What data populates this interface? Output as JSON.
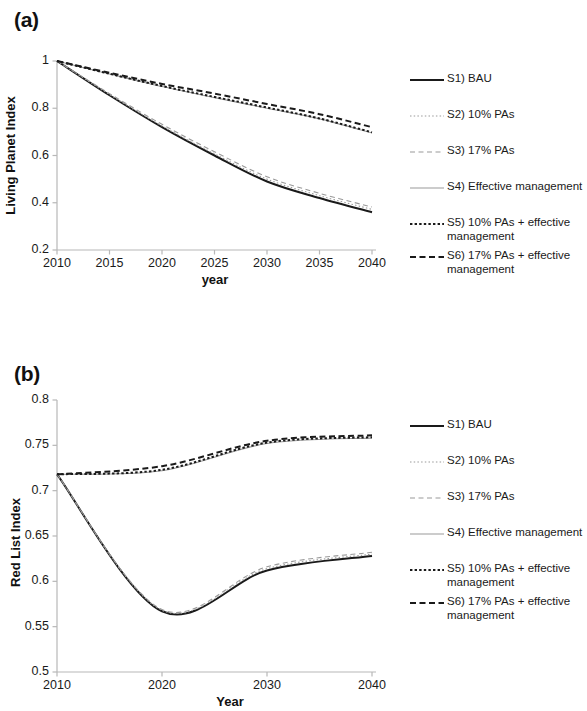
{
  "figure": {
    "panels": [
      {
        "id": "a",
        "label": "(a)",
        "ylabel": "Living Planet Index",
        "xlabel": "year"
      },
      {
        "id": "b",
        "label": "(b)",
        "ylabel": "Red List Index",
        "xlabel": "Year"
      }
    ]
  },
  "legend": {
    "items": [
      {
        "key": "S1",
        "label": "S1) BAU",
        "style": "solid-thick-dark",
        "color": "#1a1a1a"
      },
      {
        "key": "S2",
        "label": "S2) 10% PAs",
        "style": "dotted-light",
        "color": "#9a9a9a"
      },
      {
        "key": "S3",
        "label": "S3) 17% PAs",
        "style": "dashed-light",
        "color": "#9a9a9a"
      },
      {
        "key": "S4",
        "label": "S4) Effective management",
        "style": "solid-thin-light",
        "color": "#9a9a9a"
      },
      {
        "key": "S5",
        "label": "S5) 10% PAs + effective\nmanagement",
        "style": "dotted-dark",
        "color": "#1a1a1a"
      },
      {
        "key": "S6",
        "label": "S6) 17% PAs + effective\nmanagement",
        "style": "dashed-dark",
        "color": "#1a1a1a"
      }
    ]
  },
  "chart_data": [
    {
      "type": "line",
      "panel": "a",
      "title": "",
      "xlabel": "year",
      "ylabel": "Living Planet Index",
      "xlim": [
        2010,
        2040
      ],
      "ylim": [
        0.2,
        1.0
      ],
      "xticks": [
        2010,
        2015,
        2020,
        2025,
        2030,
        2035,
        2040
      ],
      "xtick_labels": [
        "2010",
        "2015",
        "2020",
        "2025",
        "2030",
        "2035",
        "2040"
      ],
      "yticks": [
        0.2,
        0.4,
        0.6,
        0.8,
        1.0
      ],
      "ytick_labels": [
        "0.2",
        "0.4",
        "0.6",
        "0.8",
        "1"
      ],
      "grid": false,
      "legend_position": "right",
      "x": [
        2010,
        2015,
        2020,
        2025,
        2030,
        2035,
        2040
      ],
      "series": [
        {
          "name": "S1) BAU",
          "style": "solid-thick-dark",
          "color": "#1a1a1a",
          "values": [
            1.0,
            0.855,
            0.72,
            0.6,
            0.49,
            0.42,
            0.36
          ]
        },
        {
          "name": "S2) 10% PAs",
          "style": "dotted-light",
          "color": "#9a9a9a",
          "values": [
            1.0,
            0.858,
            0.725,
            0.607,
            0.5,
            0.43,
            0.372
          ]
        },
        {
          "name": "S3) 17% PAs",
          "style": "dashed-light",
          "color": "#9a9a9a",
          "values": [
            1.0,
            0.862,
            0.732,
            0.616,
            0.51,
            0.44,
            0.382
          ]
        },
        {
          "name": "S4) Effective management",
          "style": "solid-thin-light",
          "color": "#9a9a9a",
          "values": [
            1.0,
            0.945,
            0.892,
            0.845,
            0.8,
            0.755,
            0.695
          ]
        },
        {
          "name": "S5) 10% PAs + effective management",
          "style": "dotted-dark",
          "color": "#1a1a1a",
          "values": [
            1.0,
            0.946,
            0.894,
            0.848,
            0.803,
            0.757,
            0.698
          ]
        },
        {
          "name": "S6) 17% PAs + effective management",
          "style": "dashed-dark",
          "color": "#1a1a1a",
          "values": [
            1.0,
            0.95,
            0.903,
            0.862,
            0.818,
            0.775,
            0.72
          ]
        }
      ]
    },
    {
      "type": "line",
      "panel": "b",
      "title": "",
      "xlabel": "Year",
      "ylabel": "Red List Index",
      "xlim": [
        2010,
        2040
      ],
      "ylim": [
        0.5,
        0.8
      ],
      "xticks": [
        2010,
        2020,
        2030,
        2040
      ],
      "xtick_labels": [
        "2010",
        "2020",
        "2030",
        "2040"
      ],
      "yticks": [
        0.5,
        0.55,
        0.6,
        0.65,
        0.7,
        0.75,
        0.8
      ],
      "ytick_labels": [
        "0.5",
        "0.55",
        "0.6",
        "0.65",
        "0.7",
        "0.75",
        "0.8"
      ],
      "grid": false,
      "legend_position": "right",
      "x": [
        2010,
        2020,
        2030,
        2040
      ],
      "series": [
        {
          "name": "S1) BAU",
          "style": "solid-thick-dark",
          "color": "#1a1a1a",
          "values": [
            0.718,
            0.567,
            0.612,
            0.628
          ]
        },
        {
          "name": "S2) 10% PAs",
          "style": "dotted-light",
          "color": "#9a9a9a",
          "values": [
            0.718,
            0.568,
            0.614,
            0.63
          ]
        },
        {
          "name": "S3) 17% PAs",
          "style": "dashed-light",
          "color": "#9a9a9a",
          "values": [
            0.718,
            0.569,
            0.616,
            0.632
          ]
        },
        {
          "name": "S4) Effective management",
          "style": "solid-thin-light",
          "color": "#9a9a9a",
          "values": [
            0.718,
            0.722,
            0.752,
            0.758
          ]
        },
        {
          "name": "S5) 10% PAs + effective management",
          "style": "dotted-dark",
          "color": "#1a1a1a",
          "values": [
            0.718,
            0.723,
            0.753,
            0.759
          ]
        },
        {
          "name": "S6) 17% PAs + effective management",
          "style": "dashed-dark",
          "color": "#1a1a1a",
          "values": [
            0.718,
            0.727,
            0.755,
            0.761
          ]
        }
      ]
    }
  ]
}
